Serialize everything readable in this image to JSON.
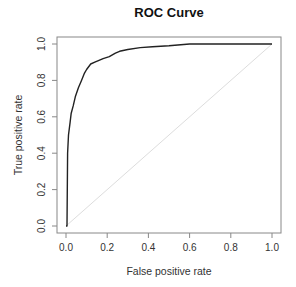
{
  "chart_data": {
    "type": "line",
    "title": "ROC Curve",
    "xlabel": "False positive rate",
    "ylabel": "True positive rate",
    "xlim": [
      0,
      1
    ],
    "ylim": [
      0,
      1
    ],
    "grid": false,
    "legend": null,
    "x_ticks": [
      "0.0",
      "0.2",
      "0.4",
      "0.6",
      "0.8",
      "1.0"
    ],
    "y_ticks": [
      "0.0",
      "0.2",
      "0.4",
      "0.6",
      "0.8",
      "1.0"
    ],
    "series": [
      {
        "name": "ROC",
        "color": "#222222",
        "x": [
          0.0,
          0.005,
          0.008,
          0.012,
          0.02,
          0.025,
          0.035,
          0.045,
          0.06,
          0.075,
          0.09,
          0.1,
          0.12,
          0.14,
          0.16,
          0.18,
          0.21,
          0.24,
          0.26,
          0.3,
          0.36,
          0.42,
          0.5,
          0.6,
          0.7,
          0.8,
          0.9,
          1.0
        ],
        "y": [
          0.0,
          0.0,
          0.4,
          0.5,
          0.57,
          0.62,
          0.66,
          0.71,
          0.76,
          0.8,
          0.84,
          0.86,
          0.89,
          0.9,
          0.91,
          0.92,
          0.93,
          0.95,
          0.96,
          0.97,
          0.98,
          0.985,
          0.99,
          1.0,
          1.0,
          1.0,
          1.0,
          1.0
        ]
      },
      {
        "name": "Random classifier",
        "color": "#dddddd",
        "x": [
          0,
          1
        ],
        "y": [
          0,
          1
        ]
      }
    ]
  }
}
